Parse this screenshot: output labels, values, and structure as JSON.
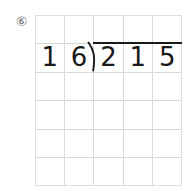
{
  "problem": {
    "number_label": "⑥",
    "expression": "215 ÷ 16",
    "divisor": "16",
    "dividend": "215"
  },
  "grid": {
    "columns": 5,
    "rows": 6,
    "line_color": "#d9d9d9",
    "cell_width": 29.4,
    "cell_height": 28.5
  },
  "digits": {
    "row_index": 1,
    "cells": [
      {
        "col": 0,
        "value": "1",
        "role": "divisor-tens"
      },
      {
        "col": 1,
        "value": "6",
        "role": "divisor-ones"
      },
      {
        "col": 2,
        "value": "2",
        "role": "dividend-hundreds"
      },
      {
        "col": 3,
        "value": "1",
        "role": "dividend-tens"
      },
      {
        "col": 4,
        "value": "5",
        "role": "dividend-ones"
      }
    ]
  },
  "symbols": {
    "division_bracket": "long-division-bracket",
    "vinculum": "overbar"
  },
  "colors": {
    "ink": "#1a1a1a",
    "grid": "#d9d9d9",
    "label": "#6e6e6e",
    "paper": "#ffffff"
  }
}
